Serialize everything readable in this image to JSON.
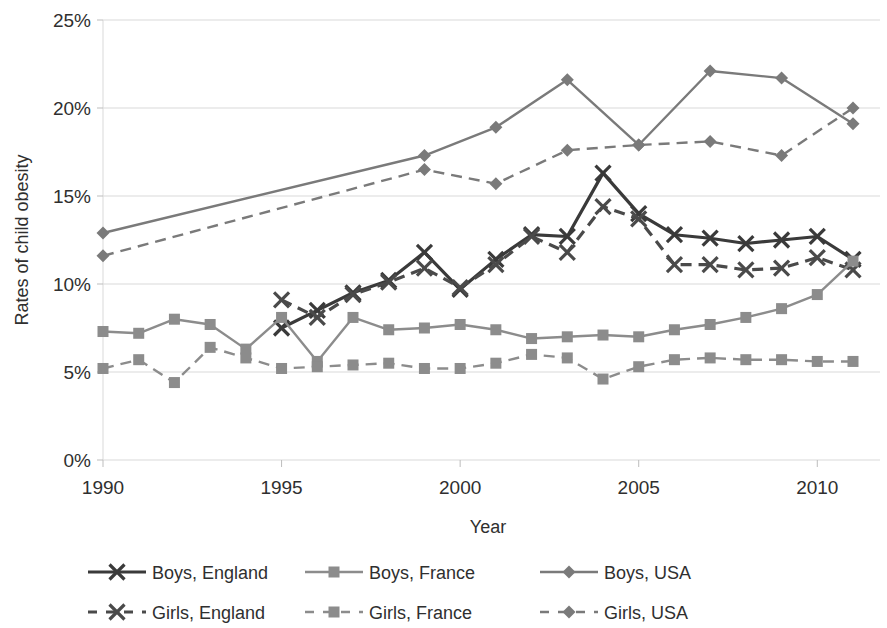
{
  "chart_data": {
    "type": "line",
    "title": "",
    "xlabel": "Year",
    "ylabel": "Rates of child obesity",
    "xlim": [
      1990,
      2011.5
    ],
    "ylim": [
      0,
      25
    ],
    "x_ticks": [
      1990,
      1995,
      2000,
      2005,
      2010
    ],
    "x_tick_labels": [
      "1990",
      "1995",
      "2000",
      "2005",
      "2010"
    ],
    "y_ticks": [
      0,
      5,
      10,
      15,
      20,
      25
    ],
    "y_tick_labels": [
      "0%",
      "5%",
      "10%",
      "15%",
      "20%",
      "25%"
    ],
    "grid": false,
    "legend_position": "bottom",
    "series": [
      {
        "name": "Boys, England",
        "marker": "x",
        "line_style": "solid",
        "color": "#3a3a3a",
        "x": [
          1995,
          1996,
          1997,
          1998,
          1999,
          2000,
          2001,
          2002,
          2003,
          2004,
          2005,
          2006,
          2007,
          2008,
          2009,
          2010,
          2011
        ],
        "values": [
          7.5,
          8.5,
          9.5,
          10.2,
          11.8,
          9.7,
          11.4,
          12.8,
          12.7,
          16.3,
          14.0,
          12.8,
          12.6,
          12.3,
          12.5,
          12.7,
          11.4
        ]
      },
      {
        "name": "Girls, England",
        "marker": "x",
        "line_style": "dashed",
        "color": "#4a4a4a",
        "x": [
          1995,
          1996,
          1997,
          1998,
          1999,
          2000,
          2001,
          2002,
          2003,
          2004,
          2005,
          2006,
          2007,
          2008,
          2009,
          2010,
          2011
        ],
        "values": [
          9.1,
          8.1,
          9.4,
          10.1,
          10.9,
          9.8,
          11.1,
          12.7,
          11.8,
          14.4,
          13.7,
          11.1,
          11.1,
          10.8,
          10.9,
          11.5,
          10.8
        ]
      },
      {
        "name": "Boys, France",
        "marker": "square",
        "line_style": "solid",
        "color": "#8c8c8c",
        "x": [
          1990,
          1991,
          1992,
          1993,
          1994,
          1995,
          1996,
          1997,
          1998,
          1999,
          2000,
          2001,
          2002,
          2003,
          2004,
          2005,
          2006,
          2007,
          2008,
          2009,
          2010,
          2011
        ],
        "values": [
          7.3,
          7.2,
          8.0,
          7.7,
          6.3,
          8.1,
          5.6,
          8.1,
          7.4,
          7.5,
          7.7,
          7.4,
          6.9,
          7.0,
          7.1,
          7.0,
          7.4,
          7.7,
          8.1,
          8.6,
          9.4,
          11.3
        ]
      },
      {
        "name": "Girls, France",
        "marker": "square",
        "line_style": "dashed",
        "color": "#8c8c8c",
        "x": [
          1990,
          1991,
          1992,
          1993,
          1994,
          1995,
          1996,
          1997,
          1998,
          1999,
          2000,
          2001,
          2002,
          2003,
          2004,
          2005,
          2006,
          2007,
          2008,
          2009,
          2010,
          2011
        ],
        "values": [
          5.2,
          5.7,
          4.4,
          6.4,
          5.8,
          5.2,
          5.3,
          5.4,
          5.5,
          5.2,
          5.2,
          5.5,
          6.0,
          5.8,
          4.6,
          5.3,
          5.7,
          5.8,
          5.7,
          5.7,
          5.6,
          5.6
        ]
      },
      {
        "name": "Boys, USA",
        "marker": "diamond",
        "line_style": "solid",
        "color": "#7a7a7a",
        "x": [
          1990,
          1999,
          2001,
          2003,
          2005,
          2007,
          2009,
          2011
        ],
        "values": [
          12.9,
          17.3,
          18.9,
          21.6,
          17.9,
          22.1,
          21.7,
          19.1
        ]
      },
      {
        "name": "Girls, USA",
        "marker": "diamond",
        "line_style": "dashed",
        "color": "#7a7a7a",
        "x": [
          1990,
          1999,
          2001,
          2003,
          2005,
          2007,
          2009,
          2011
        ],
        "values": [
          11.6,
          16.5,
          15.7,
          17.6,
          17.9,
          18.1,
          17.3,
          20.0
        ]
      }
    ]
  },
  "legend": {
    "items": [
      {
        "label": "Boys, England"
      },
      {
        "label": "Boys, France"
      },
      {
        "label": "Boys, USA"
      },
      {
        "label": "Girls, England"
      },
      {
        "label": "Girls, France"
      },
      {
        "label": "Girls, USA"
      }
    ]
  }
}
